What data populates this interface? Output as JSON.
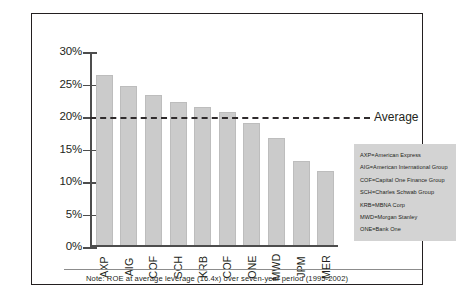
{
  "chart_data": {
    "type": "bar",
    "title": "",
    "xlabel": "",
    "ylabel": "",
    "ylim": [
      0,
      30
    ],
    "grid": false,
    "ytick_labels": [
      "30%",
      "25%",
      "20%",
      "15%",
      "10%",
      "5%",
      "0%"
    ],
    "ytick_values": [
      30,
      25,
      20,
      15,
      10,
      5,
      0
    ],
    "categories": [
      "AXP",
      "AIG",
      "COF",
      "SCH",
      "KRB",
      "COF",
      "ONE",
      "MWD",
      "JPM",
      "MER"
    ],
    "values": [
      26.2,
      24.6,
      23.2,
      22.1,
      21.3,
      20.6,
      18.8,
      16.5,
      13.0,
      11.5
    ],
    "annotations": [
      {
        "name": "average-line",
        "label": "Average",
        "value": 20,
        "style": "dashed-horizontal"
      }
    ],
    "legend_position": "inside-right",
    "legend_entries": [
      "AXP=American Express",
      "AIG=American International Group",
      "COF=Capital One Finance Group",
      "SCH=Charles Schwab Group",
      "KRB=MBNA Corp",
      "MWD=Morgan Stanley",
      "ONE=Bank One"
    ],
    "note": "Note: ROE at average leverage (16.4x) over seven-year period (1995-2002)",
    "colors": {
      "bar_fill": "#cbcbcb",
      "bar_border": "#bdbdbd",
      "axis": "#4d4d4d",
      "text": "#231f20",
      "legend_bg": "#d3d3d3",
      "average_line": "#2f2b2c",
      "frame_border": "#231f20"
    }
  }
}
